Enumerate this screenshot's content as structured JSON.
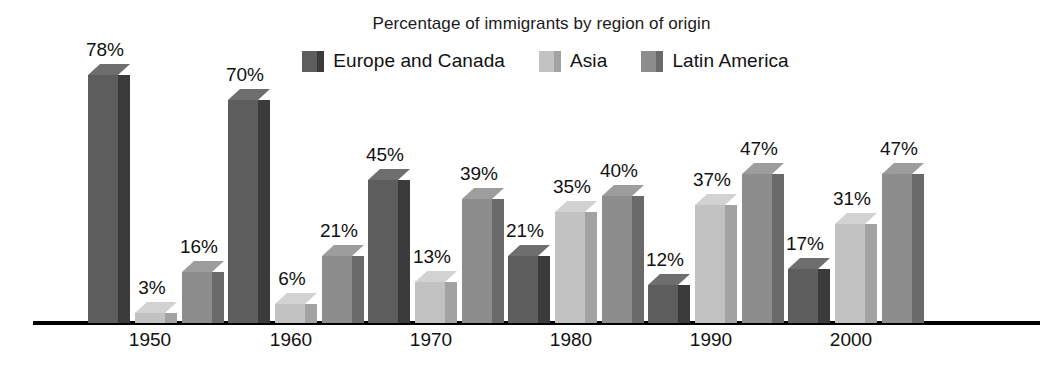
{
  "chart_data": {
    "type": "bar",
    "title": "Percentage of immigrants by region of origin",
    "xlabel": "",
    "ylabel": "",
    "ylim": [
      0,
      80
    ],
    "grid": false,
    "legend_position": "top-center",
    "value_suffix": "%",
    "categories": [
      "1950",
      "1960",
      "1970",
      "1980",
      "1990",
      "2000"
    ],
    "series": [
      {
        "name": "Europe and Canada",
        "color": "#5d5d5d",
        "side_color": "#3b3b3b",
        "top_color": "#6e6e6e",
        "values": [
          78,
          70,
          45,
          21,
          12,
          17
        ],
        "labels": [
          "78%",
          "70%",
          "45%",
          "21%",
          "12%",
          "17%"
        ]
      },
      {
        "name": "Asia",
        "color": "#c2c2c2",
        "side_color": "#a2a2a2",
        "top_color": "#d2d2d2",
        "values": [
          3,
          6,
          13,
          35,
          37,
          31
        ],
        "labels": [
          "3%",
          "6%",
          "13%",
          "35%",
          "37%",
          "31%"
        ]
      },
      {
        "name": "Latin America",
        "color": "#8d8d8d",
        "side_color": "#6a6a6a",
        "top_color": "#9d9d9d",
        "values": [
          16,
          21,
          39,
          40,
          47,
          47
        ],
        "labels": [
          "16%",
          "21%",
          "39%",
          "40%",
          "47%",
          "47%"
        ]
      }
    ]
  },
  "axis": {
    "baseline_color": "#000000"
  }
}
